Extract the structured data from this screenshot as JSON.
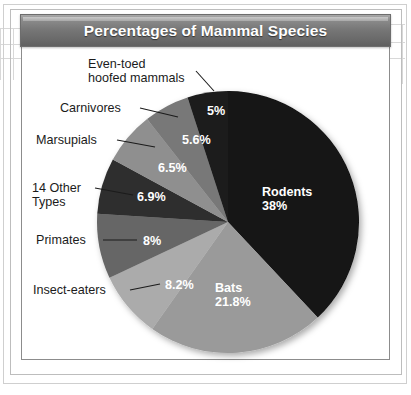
{
  "figure": {
    "title": "Percentages of Mammal Species"
  },
  "chart_data": {
    "type": "pie",
    "title": "Percentages of Mammal Species",
    "xlabel": "",
    "ylabel": "",
    "legend_position": "none",
    "grid": false,
    "unit": "percent",
    "categories": [
      "Rodents",
      "Bats",
      "Insect-eaters",
      "Primates",
      "14 Other Types",
      "Marsupials",
      "Carnivores",
      "Even-toed hoofed mammals"
    ],
    "values": [
      38,
      21.8,
      8.2,
      8,
      6.9,
      6.5,
      5.6,
      5
    ],
    "value_labels": [
      "38%",
      "21.8%",
      "8.2%",
      "8%",
      "6.9%",
      "6.5%",
      "5.6%",
      "5%"
    ],
    "colors": [
      "#121212",
      "#9a9a9a",
      "#ababab",
      "#666666",
      "#2e2e2e",
      "#8f8f8f",
      "#787878",
      "#1c1c1c"
    ],
    "slices": [
      {
        "name": "Rodents",
        "value": 38,
        "label": "Rodents",
        "value_label": "38%",
        "color": "#121212",
        "label_placement": "inside"
      },
      {
        "name": "Bats",
        "value": 21.8,
        "label": "Bats",
        "value_label": "21.8%",
        "color": "#9a9a9a",
        "label_placement": "inside"
      },
      {
        "name": "Insect-eaters",
        "value": 8.2,
        "label": "Insect-eaters",
        "value_label": "8.2%",
        "color": "#ababab",
        "label_placement": "callout"
      },
      {
        "name": "Primates",
        "value": 8,
        "label": "Primates",
        "value_label": "8%",
        "color": "#666666",
        "label_placement": "callout"
      },
      {
        "name": "14 Other Types",
        "value": 6.9,
        "label": "14 Other\nTypes",
        "value_label": "6.9%",
        "color": "#2e2e2e",
        "label_placement": "callout"
      },
      {
        "name": "Marsupials",
        "value": 6.5,
        "label": "Marsupials",
        "value_label": "6.5%",
        "color": "#8f8f8f",
        "label_placement": "callout"
      },
      {
        "name": "Carnivores",
        "value": 5.6,
        "label": "Carnivores",
        "value_label": "5.6%",
        "color": "#787878",
        "label_placement": "callout"
      },
      {
        "name": "Even-toed hoofed mammals",
        "value": 5,
        "label": "Even-toed\nhoofed mammals",
        "value_label": "5%",
        "color": "#1c1c1c",
        "label_placement": "callout"
      }
    ]
  },
  "callouts": {
    "even_toed": "Even-toed\nhoofed mammals",
    "carnivores": "Carnivores",
    "marsupials": "Marsupials",
    "other_types": "14 Other\nTypes",
    "primates": "Primates",
    "insect_eaters": "Insect-eaters"
  },
  "slice_values": {
    "even_toed": "5%",
    "carnivores": "5.6%",
    "marsupials": "6.5%",
    "other_types": "6.9%",
    "primates": "8%",
    "insect_eaters": "8.2%",
    "bats_name": "Bats",
    "bats_value": "21.8%",
    "rodents_name": "Rodents",
    "rodents_value": "38%"
  }
}
